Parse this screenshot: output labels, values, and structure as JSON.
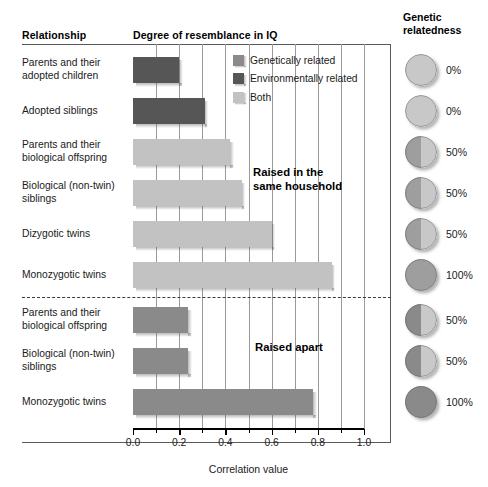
{
  "headers": {
    "relationship": "Relationship",
    "resemblance": "Degree of resemblance in IQ",
    "genetic_relatedness": "Genetic\nrelatedness"
  },
  "legend": {
    "items": [
      {
        "label": "Genetically related",
        "color": "#8a8a8a",
        "key": "gen"
      },
      {
        "label": "Environmentally related",
        "color": "#565656",
        "key": "env"
      },
      {
        "label": "Both",
        "color": "#c2c2c2",
        "key": "both"
      }
    ]
  },
  "annotations": {
    "together": "Raised in the\nsame household",
    "apart": "Raised apart"
  },
  "axis": {
    "title": "Correlation value",
    "tick_labels": [
      "0.0",
      "0.2",
      "0.4",
      "0.6",
      "0.8",
      "1.0"
    ],
    "tick_values": [
      0.0,
      0.2,
      0.4,
      0.6,
      0.8,
      1.0
    ],
    "minor_tick_values": [
      0.1,
      0.3,
      0.5,
      0.7,
      0.9
    ],
    "min": 0.0,
    "max": 1.0
  },
  "chart_data": {
    "type": "bar",
    "title": "Degree of resemblance in IQ",
    "xlabel": "Correlation value",
    "ylabel": "Relationship",
    "xlim": [
      0.0,
      1.0
    ],
    "orientation": "horizontal",
    "grid": true,
    "legend_position": "top-right-inside",
    "categories": [
      "Parents and their adopted children",
      "Adopted siblings",
      "Parents and their biological offspring",
      "Biological (non-twin) siblings",
      "Dizygotic twins",
      "Monozygotic twins",
      "Parents and their biological offspring",
      "Biological (non-twin) siblings",
      "Monozygotic twins"
    ],
    "values": [
      0.2,
      0.31,
      0.42,
      0.47,
      0.6,
      0.86,
      0.24,
      0.24,
      0.78
    ],
    "series": [
      {
        "name": "Environmentally related",
        "color": "#565656",
        "points": [
          {
            "category": "Parents and their adopted children",
            "value": 0.2
          },
          {
            "category": "Adopted siblings",
            "value": 0.31
          }
        ]
      },
      {
        "name": "Both",
        "color": "#c2c2c2",
        "points": [
          {
            "category": "Parents and their biological offspring",
            "value": 0.42
          },
          {
            "category": "Biological (non-twin) siblings",
            "value": 0.47
          },
          {
            "category": "Dizygotic twins",
            "value": 0.6
          },
          {
            "category": "Monozygotic twins",
            "value": 0.86
          }
        ]
      },
      {
        "name": "Genetically related",
        "color": "#8a8a8a",
        "points": [
          {
            "category": "Parents and their biological offspring",
            "value": 0.24
          },
          {
            "category": "Biological (non-twin) siblings",
            "value": 0.24
          },
          {
            "category": "Monozygotic twins",
            "value": 0.78
          }
        ]
      }
    ],
    "groups": [
      {
        "name": "Raised in the same household",
        "rows": [
          0,
          1,
          2,
          3,
          4,
          5
        ]
      },
      {
        "name": "Raised apart",
        "rows": [
          6,
          7,
          8
        ]
      }
    ]
  },
  "rows": [
    {
      "label": "Parents and their\nadopted children",
      "value": 0.2,
      "kind": "env",
      "relatedness": "0%",
      "relatedness_fraction": 0.0,
      "circle_shade": "light"
    },
    {
      "label": "Adopted siblings",
      "value": 0.31,
      "kind": "env",
      "relatedness": "0%",
      "relatedness_fraction": 0.0,
      "circle_shade": "light"
    },
    {
      "label": "Parents and their\nbiological offspring",
      "value": 0.42,
      "kind": "both",
      "relatedness": "50%",
      "relatedness_fraction": 0.5,
      "circle_shade": "light"
    },
    {
      "label": "Biological (non-twin)\nsiblings",
      "value": 0.47,
      "kind": "both",
      "relatedness": "50%",
      "relatedness_fraction": 0.5,
      "circle_shade": "light"
    },
    {
      "label": "Dizygotic twins",
      "value": 0.6,
      "kind": "both",
      "relatedness": "50%",
      "relatedness_fraction": 0.5,
      "circle_shade": "light"
    },
    {
      "label": "Monozygotic twins",
      "value": 0.86,
      "kind": "both",
      "relatedness": "100%",
      "relatedness_fraction": 1.0,
      "circle_shade": "light"
    },
    {
      "label": "Parents and their\nbiological offspring",
      "value": 0.24,
      "kind": "gen",
      "relatedness": "50%",
      "relatedness_fraction": 0.5,
      "circle_shade": "dark"
    },
    {
      "label": "Biological (non-twin)\nsiblings",
      "value": 0.24,
      "kind": "gen",
      "relatedness": "50%",
      "relatedness_fraction": 0.5,
      "circle_shade": "dark"
    },
    {
      "label": "Monozygotic twins",
      "value": 0.78,
      "kind": "gen",
      "relatedness": "100%",
      "relatedness_fraction": 1.0,
      "circle_shade": "dark"
    }
  ],
  "colors": {
    "environmentally_related": "#565656",
    "both": "#c2c2c2",
    "genetically_related": "#8a8a8a",
    "circle_light": "#c8c8c8",
    "circle_dark": "#8a8a8a",
    "gridline": "#9a9a9a"
  }
}
